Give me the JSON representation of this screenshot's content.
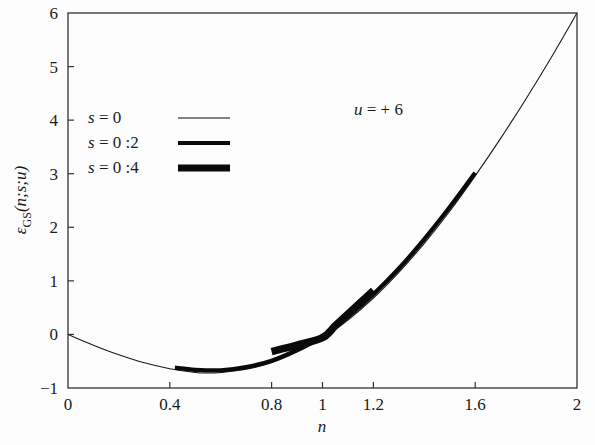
{
  "chart_data": {
    "type": "line",
    "title": "",
    "xlabel": "n",
    "ylabel_parts": {
      "epsilon": "ε",
      "subscript": "GS",
      "args": "(n;s;u)"
    },
    "ylabel": "εGS(n;s;u)",
    "xlim": [
      0,
      2
    ],
    "ylim": [
      -1,
      6
    ],
    "grid": false,
    "xticks": [
      0,
      0.4,
      0.8,
      1,
      1.2,
      1.6,
      2
    ],
    "xtick_labels": [
      "0",
      "0.4",
      "0.8",
      "1",
      "1.2",
      "1.6",
      "2"
    ],
    "yticks": [
      -1,
      0,
      1,
      2,
      3,
      4,
      5,
      6
    ],
    "ytick_labels": [
      "-1",
      "0",
      "1",
      "2",
      "3",
      "4",
      "5",
      "6"
    ],
    "annotations": [
      {
        "name": "u-value",
        "text": "u = + 6",
        "x": 1.22,
        "y": 4.1
      }
    ],
    "legend": {
      "position": "upper-left",
      "entries": [
        {
          "label": "s = 0",
          "style": "thin",
          "linewidth": 1
        },
        {
          "label": "s = 0 :2",
          "style": "medium",
          "linewidth": 4
        },
        {
          "label": "s = 0 :4",
          "style": "thick",
          "linewidth": 7
        }
      ]
    },
    "series": [
      {
        "name": "s = 0",
        "style": "thin",
        "linewidth": 1.1,
        "color": "#1a1a1a",
        "x": [
          0.0,
          0.1,
          0.2,
          0.3,
          0.4,
          0.5,
          0.55,
          0.6,
          0.7,
          0.8,
          0.9,
          1.0,
          1.1,
          1.2,
          1.3,
          1.4,
          1.5,
          1.6,
          1.7,
          1.8,
          1.9,
          2.0
        ],
        "y": [
          0.0,
          -0.2,
          -0.38,
          -0.53,
          -0.64,
          -0.71,
          -0.72,
          -0.71,
          -0.65,
          -0.53,
          -0.33,
          -0.07,
          0.27,
          0.68,
          1.16,
          1.7,
          2.3,
          2.96,
          3.66,
          4.4,
          5.18,
          6.0
        ]
      },
      {
        "name": "s = 0 :2",
        "style": "medium",
        "linewidth": 4.2,
        "color": "#0a0a0a",
        "x": [
          0.42,
          0.5,
          0.6,
          0.7,
          0.8,
          0.9,
          1.0,
          1.1,
          1.2,
          1.3,
          1.4,
          1.5,
          1.6
        ],
        "y": [
          -0.62,
          -0.66,
          -0.67,
          -0.61,
          -0.49,
          -0.29,
          -0.03,
          0.33,
          0.75,
          1.23,
          1.78,
          2.38,
          3.02
        ]
      },
      {
        "name": "s = 0 :4",
        "style": "thick",
        "linewidth": 7.5,
        "color": "#0a0a0a",
        "x": [
          0.8,
          0.9,
          1.0,
          1.05,
          1.1,
          1.15,
          1.2
        ],
        "y": [
          -0.32,
          -0.2,
          -0.06,
          0.16,
          0.38,
          0.6,
          0.82
        ]
      }
    ]
  },
  "axes": {
    "frame_color": "#333333",
    "background": "#ffffff"
  }
}
